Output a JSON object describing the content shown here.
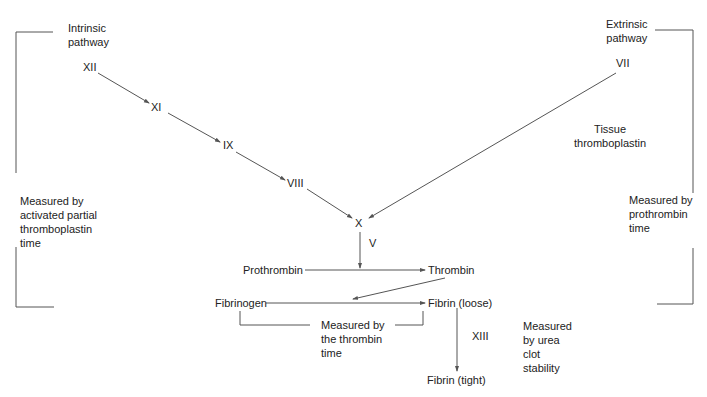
{
  "diagram": {
    "pathways": {
      "intrinsic": {
        "label_line1": "Intrinsic",
        "label_line2": "pathway"
      },
      "extrinsic": {
        "label_line1": "Extrinsic",
        "label_line2": "pathway"
      }
    },
    "factors": {
      "xii": "XII",
      "xi": "XI",
      "ix": "IX",
      "viii": "VIII",
      "vii": "VII",
      "x": "X",
      "v": "V",
      "xiii": "XIII"
    },
    "tissue_thromboplastin": {
      "line1": "Tissue",
      "line2": "thromboplastin"
    },
    "substances": {
      "prothrombin": "Prothrombin",
      "thrombin": "Thrombin",
      "fibrinogen": "Fibrinogen",
      "fibrin_loose": "Fibrin (loose)",
      "fibrin_tight": "Fibrin (tight)"
    },
    "measurements": {
      "aptt": {
        "line1": "Measured by",
        "line2": "activated partial",
        "line3": "thromboplastin",
        "line4": "time"
      },
      "pt": {
        "line1": "Measured by",
        "line2": "prothrombin",
        "line3": "time"
      },
      "thrombin_time": {
        "line1": "Measured by",
        "line2": "the thrombin",
        "line3": "time"
      },
      "urea": {
        "line1": "Measured",
        "line2": "by urea",
        "line3": "clot",
        "line4": "stability"
      }
    },
    "colors": {
      "line": "#555555",
      "text": "#222222",
      "background": "#ffffff"
    }
  }
}
